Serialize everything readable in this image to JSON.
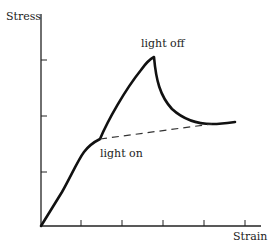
{
  "diagram": {
    "type": "stress-strain curve",
    "axes": {
      "y_label": "Stress",
      "x_label": "Strain",
      "x_ticks": 5,
      "y_ticks": 3
    },
    "annotations": {
      "light_off": "light off",
      "light_on": "light on"
    },
    "colors": {
      "line": "#111111",
      "background": "#ffffff"
    }
  }
}
